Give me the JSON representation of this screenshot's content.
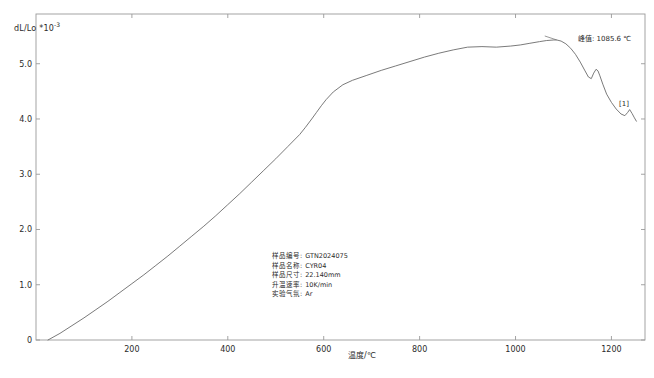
{
  "chart_data": {
    "type": "line",
    "title": "",
    "xlabel": "温度/℃",
    "ylabel": "dL/Lo *10-3",
    "ylabel_main": "dL/Lo *10",
    "ylabel_exp": "-3",
    "xlim": [
      0,
      1270
    ],
    "ylim": [
      0,
      5.9
    ],
    "xticks": [
      200,
      400,
      600,
      800,
      1000,
      1200
    ],
    "xtick_labels": [
      "200",
      "400",
      "600",
      "800",
      "1000",
      "1200"
    ],
    "yticks": [
      0,
      1.0,
      2.0,
      3.0,
      4.0,
      5.0
    ],
    "ytick_labels": [
      "0",
      "1.0",
      "2.0",
      "3.0",
      "4.0",
      "5.0"
    ],
    "grid": false,
    "legend": "none",
    "series": [
      {
        "name": "[1]",
        "color": "#6b6b6b",
        "x": [
          25,
          50,
          75,
          100,
          125,
          150,
          175,
          200,
          225,
          250,
          275,
          300,
          325,
          350,
          375,
          400,
          425,
          450,
          475,
          500,
          525,
          550,
          562,
          575,
          585,
          595,
          605,
          620,
          640,
          660,
          690,
          720,
          750,
          780,
          810,
          840,
          870,
          900,
          930,
          960,
          990,
          1010,
          1030,
          1050,
          1065,
          1080,
          1086,
          1095,
          1105,
          1115,
          1125,
          1135,
          1145,
          1152,
          1158,
          1163,
          1168,
          1172,
          1176,
          1182,
          1190,
          1200,
          1210,
          1220,
          1228,
          1234,
          1238,
          1243,
          1248,
          1252
        ],
        "y": [
          0.0,
          0.12,
          0.26,
          0.4,
          0.55,
          0.7,
          0.86,
          1.02,
          1.18,
          1.35,
          1.52,
          1.7,
          1.88,
          2.06,
          2.25,
          2.45,
          2.65,
          2.86,
          3.07,
          3.28,
          3.5,
          3.72,
          3.85,
          4.0,
          4.12,
          4.24,
          4.35,
          4.49,
          4.62,
          4.7,
          4.79,
          4.88,
          4.96,
          5.04,
          5.12,
          5.19,
          5.25,
          5.3,
          5.31,
          5.3,
          5.32,
          5.34,
          5.37,
          5.4,
          5.42,
          5.43,
          5.43,
          5.41,
          5.36,
          5.28,
          5.17,
          5.03,
          4.87,
          4.76,
          4.73,
          4.83,
          4.9,
          4.87,
          4.78,
          4.63,
          4.45,
          4.3,
          4.18,
          4.09,
          4.06,
          4.12,
          4.17,
          4.1,
          4.02,
          3.96
        ]
      }
    ],
    "annotations": [
      {
        "name": "peak-annotation",
        "text": "峰值: 1085.6 ℃",
        "x": 1086,
        "y": 5.43
      },
      {
        "name": "series-tag",
        "text": "[1]",
        "x": 1240,
        "y": 4.1
      }
    ]
  },
  "info_panel": {
    "rows": [
      {
        "key": "样品编号:",
        "value": "GTN2024075"
      },
      {
        "key": "样品名称:",
        "value": "CYR04"
      },
      {
        "key": "样品尺寸:",
        "value": "22.140mm"
      },
      {
        "key": "升温速率:",
        "value": "10K/min"
      },
      {
        "key": "实验气氛:",
        "value": "Ar"
      }
    ]
  },
  "style": {
    "line_color": "#6b6b6b",
    "frame_color": "#9a9a9a",
    "text_color": "#2b2b2b",
    "background": "#ffffff"
  }
}
